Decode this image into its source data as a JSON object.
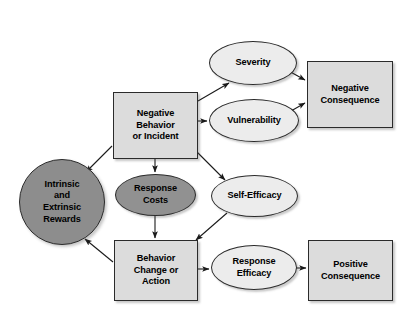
{
  "diagram": {
    "canvas": {
      "width": 415,
      "height": 322,
      "background": "#ffffff"
    },
    "palette": {
      "box_fill": "#dcdcdc",
      "ellipse_light_fill": "#ececec",
      "ellipse_dark_fill": "#919191",
      "circle_dark_fill": "#8d8d8d",
      "stroke": "#2b2b2b",
      "text": "#000000",
      "arrow": "#1a1a1a"
    },
    "nodes": [
      {
        "id": "negative-behavior",
        "label": "Negative\nBehavior\nor Incident",
        "shape": "rectangle",
        "fill": "#dcdcdc",
        "x": 113,
        "y": 92,
        "w": 85,
        "h": 67
      },
      {
        "id": "severity",
        "label": "Severity",
        "shape": "ellipse",
        "fill": "#ececec",
        "x": 209,
        "y": 41,
        "w": 88,
        "h": 44
      },
      {
        "id": "vulnerability",
        "label": "Vulnerability",
        "shape": "ellipse",
        "fill": "#ececec",
        "x": 209,
        "y": 99,
        "w": 90,
        "h": 43
      },
      {
        "id": "negative-consequence",
        "label": "Negative\nConsequence",
        "shape": "rectangle",
        "fill": "#dcdcdc",
        "x": 307,
        "y": 61,
        "w": 86,
        "h": 67
      },
      {
        "id": "intrinsic-extrinsic-rewards",
        "label": "Intrinsic\nand\nExtrinsic\nRewards",
        "shape": "circle",
        "fill": "#8d8d8d",
        "x": 19,
        "y": 159,
        "w": 86,
        "h": 86
      },
      {
        "id": "response-costs",
        "label": "Response\nCosts",
        "shape": "ellipse",
        "fill": "#919191",
        "x": 115,
        "y": 174,
        "w": 81,
        "h": 42
      },
      {
        "id": "self-efficacy",
        "label": "Self-Efficacy",
        "shape": "ellipse",
        "fill": "#ececec",
        "x": 211,
        "y": 175,
        "w": 87,
        "h": 42
      },
      {
        "id": "behavior-change",
        "label": "Behavior\nChange or\nAction",
        "shape": "rectangle",
        "fill": "#dcdcdc",
        "x": 114,
        "y": 240,
        "w": 84,
        "h": 61
      },
      {
        "id": "response-efficacy",
        "label": "Response\nEfficacy",
        "shape": "ellipse",
        "fill": "#ececec",
        "x": 211,
        "y": 245,
        "w": 86,
        "h": 45
      },
      {
        "id": "positive-consequence",
        "label": "Positive\nConsequence",
        "shape": "rectangle",
        "fill": "#dcdcdc",
        "x": 308,
        "y": 240,
        "w": 85,
        "h": 61
      }
    ],
    "edges": [
      {
        "id": "nb-to-severity",
        "from": "negative-behavior",
        "to": "severity",
        "path": "M 198 101 L 229 83"
      },
      {
        "id": "nb-to-vulnerability",
        "from": "negative-behavior",
        "to": "vulnerability",
        "path": "M 198 121 L 207 121"
      },
      {
        "id": "nb-to-self-efficacy",
        "from": "negative-behavior",
        "to": "self-efficacy",
        "path": "M 197 152 L 225 180"
      },
      {
        "id": "nb-to-response-costs",
        "from": "negative-behavior",
        "to": "response-costs",
        "path": "M 155 159 L 155 172"
      },
      {
        "id": "nb-to-rewards",
        "from": "negative-behavior",
        "to": "intrinsic-extrinsic-rewards",
        "path": "M 112 146 L 86 172"
      },
      {
        "id": "severity-to-negative-consequence",
        "from": "severity",
        "to": "negative-consequence",
        "path": "M 287 70 L 305 80"
      },
      {
        "id": "vulnerability-to-negative-consequence",
        "from": "vulnerability",
        "to": "negative-consequence",
        "path": "M 291 111 L 305 103"
      },
      {
        "id": "response-costs-to-behavior-change",
        "from": "response-costs",
        "to": "behavior-change",
        "path": "M 155 216 L 155 238"
      },
      {
        "id": "self-efficacy-to-behavior-change",
        "from": "self-efficacy",
        "to": "behavior-change",
        "path": "M 227 213 L 196 240"
      },
      {
        "id": "behavior-change-to-rewards",
        "from": "behavior-change",
        "to": "intrinsic-extrinsic-rewards",
        "path": "M 113 262 L 85 239"
      },
      {
        "id": "behavior-change-to-response-efficacy",
        "from": "behavior-change",
        "to": "response-efficacy",
        "path": "M 198 269 L 209 269"
      },
      {
        "id": "response-efficacy-to-positive-consequence",
        "from": "response-efficacy",
        "to": "positive-consequence",
        "path": "M 293 268 L 306 268"
      }
    ]
  }
}
